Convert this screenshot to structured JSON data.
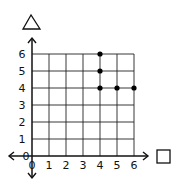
{
  "chart_data": {
    "type": "scatter",
    "title": "",
    "xlabel": "□",
    "ylabel": "△",
    "x_ticks": [
      "0",
      "1",
      "2",
      "3",
      "4",
      "5",
      "6"
    ],
    "y_ticks": [
      "0",
      "1",
      "2",
      "3",
      "4",
      "5",
      "6"
    ],
    "xlim": [
      0,
      6
    ],
    "ylim": [
      0,
      6
    ],
    "grid": true,
    "points": [
      {
        "x": 4,
        "y": 6
      },
      {
        "x": 4,
        "y": 5
      },
      {
        "x": 4,
        "y": 4
      },
      {
        "x": 5,
        "y": 4
      },
      {
        "x": 6,
        "y": 4
      }
    ]
  },
  "labels": {
    "x_axis_symbol": "square",
    "y_axis_symbol": "triangle"
  }
}
